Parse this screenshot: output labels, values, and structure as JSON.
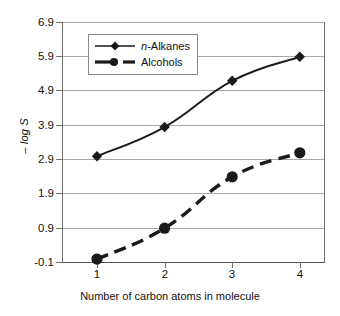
{
  "chart_data": {
    "type": "line",
    "title": "",
    "xlabel": "Number of carbon atoms in molecule",
    "ylabel": "– log S",
    "x": [
      1,
      2,
      3,
      4
    ],
    "categories": [
      "1",
      "2",
      "3",
      "4"
    ],
    "xtick_labels": [
      "1",
      "2",
      "3",
      "4"
    ],
    "ytick_labels": [
      "6.9",
      "5.9",
      "4.9",
      "3.9",
      "2.9",
      "1.9",
      "0.9",
      "-0.1"
    ],
    "ytick_values": [
      6.9,
      5.9,
      4.9,
      3.9,
      2.9,
      1.9,
      0.9,
      -0.1
    ],
    "ylim": [
      -0.1,
      6.9
    ],
    "xlim": [
      0.5,
      4.5
    ],
    "grid": "horizontal",
    "legend_position": "upper-left-inside",
    "series": [
      {
        "name": "n-Alkanes",
        "name_prefix_italic": "n",
        "name_rest": "-Alkanes",
        "marker": "diamond",
        "linestyle": "solid",
        "color": "#1a1a1a",
        "values": [
          3.0,
          3.85,
          5.2,
          5.9
        ]
      },
      {
        "name": "Alcohols",
        "marker": "circle",
        "linestyle": "dashed",
        "color": "#1a1a1a",
        "values": [
          0.0,
          0.9,
          2.4,
          3.1
        ]
      }
    ]
  },
  "legend": {
    "items": [
      {
        "label_italic": "n",
        "label_rest": "-Alkanes"
      },
      {
        "label_italic": "",
        "label_rest": "Alcohols"
      }
    ]
  },
  "colors": {
    "ink": "#1a1a1a",
    "grid": "#a6a6a6",
    "frame": "#6e6e6e",
    "background": "#ffffff"
  }
}
